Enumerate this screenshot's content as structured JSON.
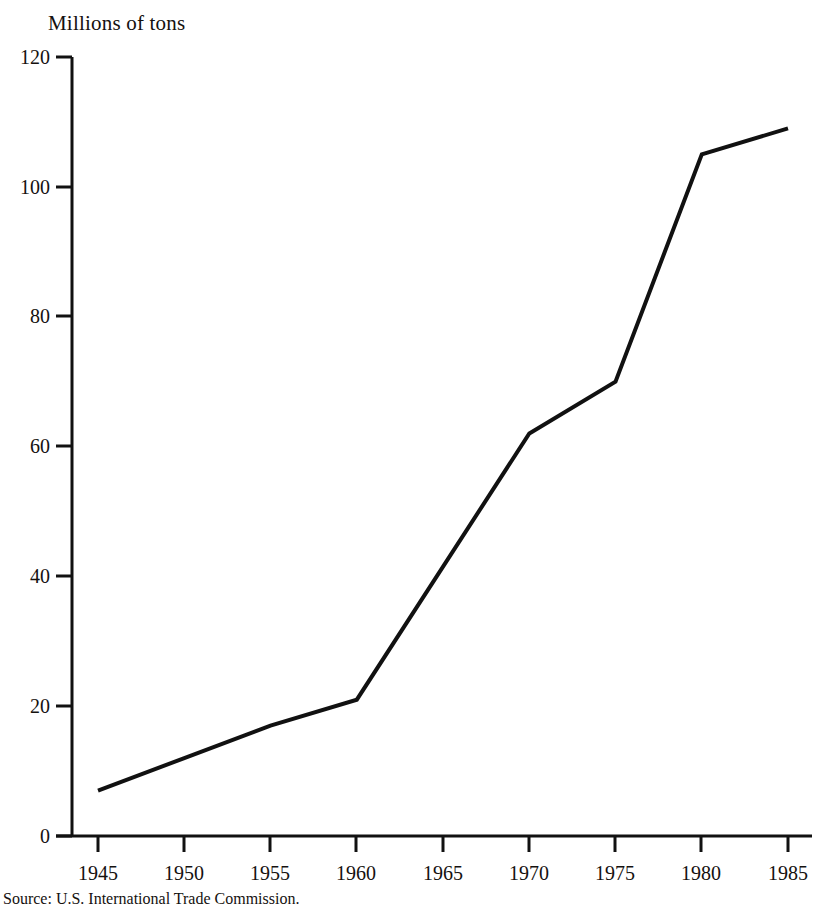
{
  "chart_data": {
    "type": "line",
    "title": "Millions of tons",
    "xlabel": "",
    "ylabel": "Millions of tons",
    "source": "Source: U.S. International Trade Commission.",
    "grid": false,
    "legend": "none",
    "line_color": "#111111",
    "x": [
      1945,
      1950,
      1955,
      1960,
      1965,
      1970,
      1975,
      1980,
      1985
    ],
    "xtick_labels": [
      "1945",
      "1950",
      "1955",
      "1960",
      "1965",
      "1970",
      "1975",
      "1980",
      "1985"
    ],
    "ytick_labels": [
      "0",
      "20",
      "40",
      "60",
      "80",
      "100",
      "120"
    ],
    "yticks": [
      0,
      20,
      40,
      60,
      80,
      100,
      120
    ],
    "xlim": [
      1945,
      1985
    ],
    "ylim": [
      0,
      120
    ],
    "series": [
      {
        "name": "Steel imports",
        "points": [
          {
            "x": 1945,
            "y": 7
          },
          {
            "x": 1950,
            "y": 12
          },
          {
            "x": 1955,
            "y": 17
          },
          {
            "x": 1960,
            "y": 21
          },
          {
            "x": 1970,
            "y": 62
          },
          {
            "x": 1975,
            "y": 70
          },
          {
            "x": 1980,
            "y": 105
          },
          {
            "x": 1985,
            "y": 109
          }
        ],
        "values": [
          7,
          12,
          17,
          21,
          41,
          62,
          70,
          105,
          109
        ]
      }
    ]
  }
}
